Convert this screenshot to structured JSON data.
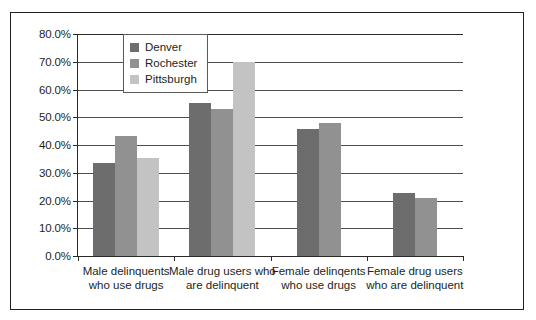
{
  "chart_data": {
    "type": "bar",
    "title": "",
    "xlabel": "",
    "ylabel": "",
    "ylim": [
      0,
      80
    ],
    "grid": true,
    "legend_position": "upper-left-inside",
    "ytick_labels": [
      "80.0%",
      "70.0%",
      "60.0%",
      "50.0%",
      "40.0%",
      "30.0%",
      "20.0%",
      "10.0%",
      "0.0%"
    ],
    "ytick_values": [
      80,
      70,
      60,
      50,
      40,
      30,
      20,
      10,
      0
    ],
    "categories": [
      "Male delinquents who use drugs",
      "Male drug users who are delinquent",
      "Female delinqents who use drugs",
      "Female drug users who are delinquent"
    ],
    "series": [
      {
        "name": "Denver",
        "color": "#6d6d6d",
        "values": [
          33.5,
          55.3,
          45.6,
          22.8
        ]
      },
      {
        "name": "Rochester",
        "color": "#919191",
        "values": [
          43.4,
          53.1,
          48.0,
          21.0
        ]
      },
      {
        "name": "Pittsburgh",
        "color": "#c3c3c3",
        "values": [
          35.5,
          70.0,
          null,
          null
        ]
      }
    ]
  }
}
